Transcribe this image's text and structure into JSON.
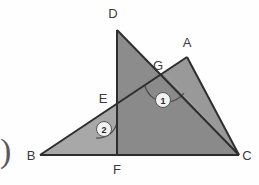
{
  "figure": {
    "type": "geometry-diagram",
    "background_color": "#fefefe",
    "stroke_color": "#2e2e2e",
    "fill_light": "#a3a3a3",
    "fill_dark": "#8c8c8c",
    "label_color": "#3a3a3a",
    "vertices": [
      {
        "id": "D",
        "label": "D",
        "x": 117,
        "y": 30,
        "label_x": 113,
        "label_y": 18
      },
      {
        "id": "A",
        "label": "A",
        "x": 187,
        "y": 57,
        "label_x": 183,
        "label_y": 46
      },
      {
        "id": "G",
        "label": "G",
        "x": 163,
        "y": 73,
        "label_x": 157,
        "label_y": 69
      },
      {
        "id": "E",
        "label": "E",
        "x": 117,
        "y": 103,
        "label_x": 100,
        "label_y": 102
      },
      {
        "id": "B",
        "label": "B",
        "x": 40,
        "y": 155,
        "label_x": 27,
        "label_y": 159
      },
      {
        "id": "F",
        "label": "F",
        "x": 117,
        "y": 155,
        "label_x": 113,
        "label_y": 172
      },
      {
        "id": "C",
        "label": "C",
        "x": 239,
        "y": 155,
        "label_x": 243,
        "label_y": 159
      }
    ],
    "segments": [
      {
        "name": "segment-BC",
        "from": "B",
        "to": "C"
      },
      {
        "name": "segment-DC",
        "from": "D",
        "to": "C"
      },
      {
        "name": "segment-DF",
        "from": "D",
        "to": "F"
      },
      {
        "name": "segment-BA",
        "from": "B",
        "to": "A"
      },
      {
        "name": "segment-AC",
        "from": "A",
        "to": "C"
      }
    ],
    "shaded_regions": [
      {
        "name": "triangle-DFC-region",
        "points": "117,30 239,155 117,155",
        "fill": "#8c8c8c"
      },
      {
        "name": "triangle-BFE-region",
        "points": "40,155 117,155 117,103",
        "fill": "#a3a3a3"
      },
      {
        "name": "triangle-AGC-region",
        "points": "187,57 239,155 163,73",
        "fill": "#9a9a9a"
      }
    ],
    "angle_marks": [
      {
        "id": "mark-1",
        "label": "1",
        "vertex": "G",
        "cx": 163,
        "cy": 100,
        "r": 7,
        "arc_r": 20
      },
      {
        "id": "mark-2",
        "label": "2",
        "vertex": "E",
        "cx": 104,
        "cy": 129,
        "r": 7,
        "arc_r": 18
      }
    ],
    "left_bracket": {
      "name": "partial-parenthesis",
      "glyph": ")",
      "x": 2,
      "y": 155
    }
  }
}
